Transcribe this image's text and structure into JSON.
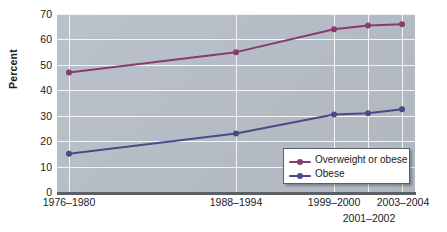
{
  "chart_data": {
    "type": "line",
    "title": "",
    "xlabel": "",
    "ylabel": "Percent",
    "categories": [
      "1976–1980",
      "1988–1994",
      "1999–2000",
      "2001–2002",
      "2003–2004"
    ],
    "series": [
      {
        "name": "Overweight or obese",
        "color": "#8a3a70",
        "values": [
          47,
          55,
          64,
          65.5,
          66
        ]
      },
      {
        "name": "Obese",
        "color": "#4b4a86",
        "values": [
          15,
          23,
          30.5,
          31,
          32.5
        ]
      }
    ],
    "ylim": [
      0,
      70
    ],
    "ytick_values": [
      0,
      10,
      20,
      30,
      40,
      50,
      60,
      70
    ],
    "ytick_labels": [
      "0",
      "10",
      "20",
      "30",
      "40",
      "50",
      "60",
      "70"
    ],
    "grid": true,
    "legend_position": "bottom-right",
    "plot_background": "#b7bec7",
    "gridline_color": "#f2f4f6",
    "axis_color": "#5b5f66"
  },
  "axis": {
    "y_title": "Percent"
  },
  "x_labels": [
    {
      "text": "1976–1980",
      "x": 69,
      "row": 0
    },
    {
      "text": "1988–1994",
      "x": 236,
      "row": 0
    },
    {
      "text": "1999–2000",
      "x": 334,
      "row": 0
    },
    {
      "text": "2003–2004",
      "x": 403,
      "row": 0
    },
    {
      "text": "2001–2002",
      "x": 369,
      "row": 1
    }
  ],
  "legend": {
    "items": [
      {
        "label": "Overweight or obese",
        "color": "#8a3a70"
      },
      {
        "label": "Obese",
        "color": "#4b4a86"
      }
    ]
  }
}
